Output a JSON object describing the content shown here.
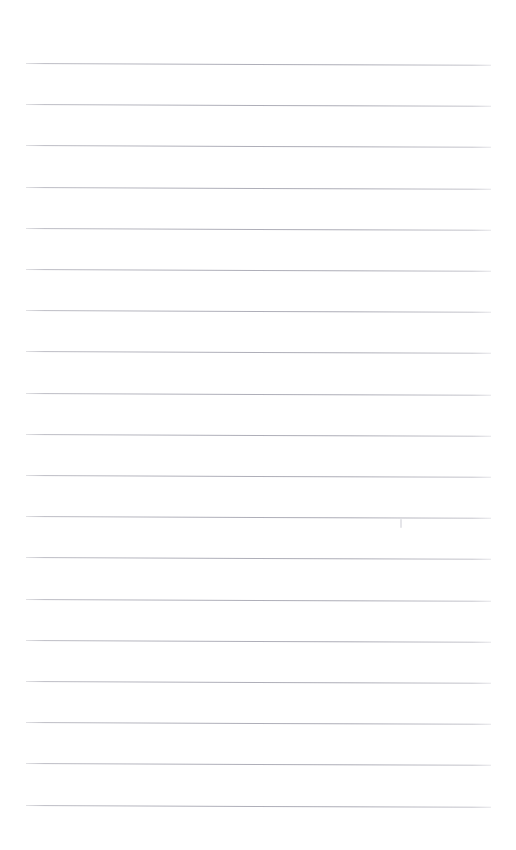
{
  "document": {
    "kind": "blank-ruled-notebook-page",
    "title": "Blank Ruled Page",
    "page_width": 516,
    "page_height": 850,
    "background_color": "#ffffff",
    "has_text": false,
    "has_handwriting": false,
    "has_header": false,
    "has_footer": false,
    "has_page_number": false,
    "has_margin_rule": false,
    "visible_text": ""
  },
  "ruling": {
    "style": "horizontal-ruled",
    "line_color": "#b0b0ba",
    "line_thickness_px": 1,
    "line_count": 19,
    "line_spacing_px": 41.2,
    "first_line_y": 63,
    "last_line_y": 804,
    "left_edge_x": 26,
    "right_edge_x": 491,
    "line_length_px": 465,
    "tilt_degrees": 0.23,
    "line_y_positions": [
      63,
      104.2,
      145.4,
      186.6,
      227.8,
      269.0,
      310.2,
      351.4,
      392.6,
      433.8,
      475.0,
      516.2,
      557.4,
      598.6,
      639.8,
      681.0,
      722.2,
      763.4,
      804.6
    ]
  },
  "margins": {
    "top_px": 63,
    "bottom_px": 45,
    "left_px": 26,
    "right_px": 25
  },
  "artifacts": [
    {
      "name": "scan-speck",
      "x": 400,
      "y": 519,
      "width": 2,
      "height": 9,
      "color": "#c6c6ce"
    }
  ]
}
